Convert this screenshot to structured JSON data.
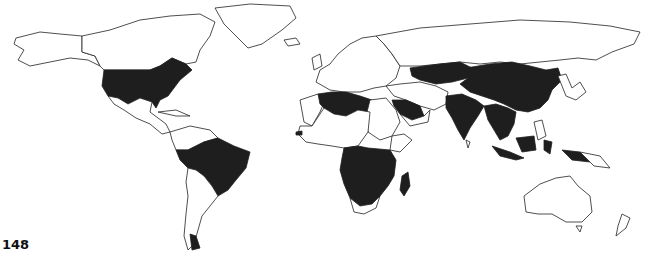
{
  "map": {
    "type": "world-choropleth",
    "projection": "equirectangular-like",
    "colors": {
      "highlighted": "#1e1e1e",
      "default": "#ffffff",
      "border": "#222222",
      "background": "#ffffff"
    },
    "highlighted_regions": [
      "United States (contiguous)",
      "Brazil",
      "Peru",
      "Ecuador",
      "Bolivia",
      "Algeria",
      "Libya",
      "Saudi Arabia",
      "Gambia",
      "DR Congo",
      "Tanzania",
      "Angola",
      "Zambia",
      "Malawi",
      "Mozambique",
      "Namibia",
      "Botswana",
      "Zimbabwe",
      "Madagascar",
      "Kazakhstan",
      "Mongolia",
      "China",
      "India",
      "Myanmar",
      "Thailand",
      "Laos",
      "Vietnam",
      "Cambodia",
      "Indonesia"
    ],
    "corner_label": "148"
  }
}
